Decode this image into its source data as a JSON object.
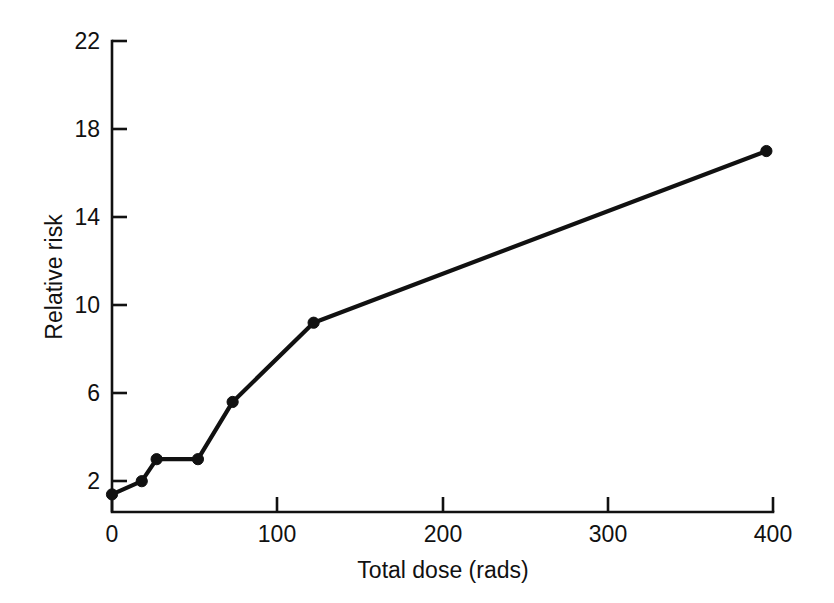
{
  "chart_data": {
    "type": "line",
    "title": "",
    "xlabel": "Total dose (rads)",
    "ylabel": "Relative risk",
    "xlim": [
      0,
      400
    ],
    "ylim": [
      0.6,
      22
    ],
    "grid": false,
    "legend": null,
    "xticks": [
      0,
      100,
      200,
      300,
      400
    ],
    "xtick_labels": [
      "0",
      "100",
      "200",
      "300",
      "400"
    ],
    "yticks": [
      2,
      6,
      10,
      14,
      18,
      22
    ],
    "ytick_labels": [
      "2",
      "6",
      "10",
      "14",
      "18",
      "22"
    ],
    "marker": "filled-circle",
    "line_color": "#111111",
    "x": [
      0,
      18,
      27,
      52,
      73,
      122,
      396
    ],
    "y": [
      1.4,
      2.0,
      3.0,
      3.0,
      5.6,
      9.2,
      17.0
    ],
    "points": [
      {
        "x": 0,
        "y": 1.4
      },
      {
        "x": 18,
        "y": 2.0
      },
      {
        "x": 27,
        "y": 3.0
      },
      {
        "x": 52,
        "y": 3.0
      },
      {
        "x": 73,
        "y": 5.6
      },
      {
        "x": 122,
        "y": 9.2
      },
      {
        "x": 396,
        "y": 17.0
      }
    ]
  },
  "labels": {
    "x_axis_title": "Total dose (rads)",
    "y_axis_title": "Relative risk",
    "x0": "0",
    "x100": "100",
    "x200": "200",
    "x300": "300",
    "x400": "400",
    "y2": "2",
    "y6": "6",
    "y10": "10",
    "y14": "14",
    "y18": "18",
    "y22": "22"
  }
}
